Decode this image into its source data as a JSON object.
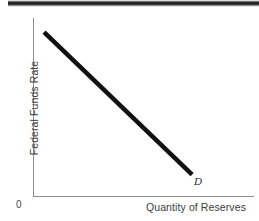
{
  "figure": {
    "background_color": "#ffffff",
    "rule_color": "#1a1a1a"
  },
  "axes": {
    "origin_label": "0",
    "y_axis_label": "Federal Funds Rate",
    "x_axis_label": "Quantity of Reserves",
    "axis_color": "#8d8d8d"
  },
  "curve": {
    "label": "D",
    "color": "#111111"
  },
  "chart_data": {
    "type": "line",
    "title": "",
    "subtitle": "",
    "xlabel": "Quantity of Reserves",
    "ylabel": "Federal Funds Rate",
    "xlim": [
      0,
      100
    ],
    "ylim": [
      0,
      100
    ],
    "grid": false,
    "legend": "none",
    "xticks": [],
    "yticks": [],
    "xtick_labels": [],
    "ytick_labels": [],
    "annotations": [
      {
        "text": "D",
        "x": 91,
        "y": 7,
        "style": "italic"
      },
      {
        "text": "0",
        "x": -6,
        "y": -6,
        "style": "normal"
      }
    ],
    "series": [
      {
        "name": "D",
        "label": "D",
        "color": "#111111",
        "linewidth": 4.5,
        "x": [
          5,
          72
        ],
        "y": [
          92,
          12
        ],
        "description": "Downward-sloping demand for reserves curve"
      }
    ]
  }
}
